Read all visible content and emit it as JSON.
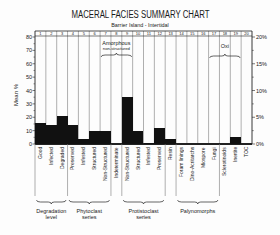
{
  "chart_data": {
    "type": "bar",
    "title": "MACERAL FACIES SUMMARY CHART",
    "subtitle": "Barrier Island - Intertidal",
    "xlabel": "",
    "ylabel": "Mean %",
    "ylabel_parts": [
      "Mean",
      "%"
    ],
    "ylim": [
      0,
      80
    ],
    "yticks": [
      0,
      10,
      20,
      30,
      40,
      50,
      60,
      70,
      80
    ],
    "y2lim": [
      0,
      20
    ],
    "y2ticks": [
      "0%",
      "5%",
      "10%",
      "15%",
      "20%"
    ],
    "y2tick_values": [
      0,
      5,
      10,
      15,
      20
    ],
    "grid": false,
    "legend": "none",
    "column_numbers": [
      "1",
      "2",
      "3",
      "4",
      "5",
      "6",
      "7",
      "8",
      "9",
      "10",
      "11",
      "12",
      "13",
      "14",
      "15",
      "16",
      "17",
      "18",
      "19",
      "20"
    ],
    "categories": [
      "Good",
      "Infected",
      "Degraded",
      "Preserved",
      "Infested",
      "Structured",
      "Non-Structured",
      "Indeterminate",
      "Non-Structured",
      "Structured",
      "Infested",
      "Preserved",
      "Resin",
      "Foram linings",
      "Dino-Acritarchs",
      "Miospore",
      "Fungi",
      "Sclerotinoids",
      "Inertite",
      "TOC"
    ],
    "values": [
      16,
      14,
      21,
      14,
      4,
      10,
      10,
      0,
      35,
      10,
      1,
      12,
      4,
      0,
      0,
      0,
      0,
      0,
      5,
      0
    ],
    "top_annotations": [
      {
        "label": "Amorphous",
        "sublabel": "non-structured",
        "from": 7,
        "to": 9
      },
      {
        "label": "Oxi",
        "sublabel": "",
        "from": 17,
        "to": 19
      }
    ],
    "groups": [
      {
        "lines": [
          "Degradation",
          "level"
        ],
        "from": 1,
        "to": 3
      },
      {
        "lines": [
          "Phytoclast",
          "series"
        ],
        "from": 4,
        "to": 7
      },
      {
        "lines": [
          "Protistoclast",
          "series"
        ],
        "from": 9,
        "to": 12
      },
      {
        "lines": [
          "Palynomorphs"
        ],
        "from": 14,
        "to": 17
      }
    ],
    "group_divider_after_columns": [
      0,
      3,
      7,
      8,
      12,
      13,
      17
    ]
  },
  "colors": {
    "bar": "#111111",
    "axis": "#222222",
    "column_line": "#7a7a7a",
    "background": "#fdfdfd"
  }
}
